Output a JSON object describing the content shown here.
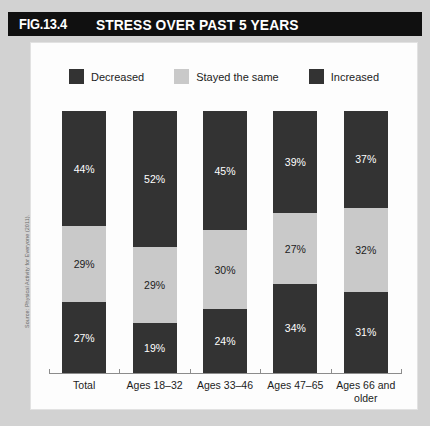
{
  "header": {
    "figure_number": "FIG.13.4",
    "title": "STRESS OVER PAST 5 YEARS"
  },
  "source": {
    "note": "Source: Physical Activity for Everyone (2011)."
  },
  "colors": {
    "banner": "#101010",
    "decreased": "#333333",
    "stayed_the_same": "#c9c9c9",
    "increased": "#333333",
    "panel_background": "#fdfdfd",
    "page_background": "#d2d2d2"
  },
  "chart_data": {
    "type": "bar",
    "subtype": "stacked-100-percent",
    "orientation": "vertical",
    "title": "STRESS OVER PAST 5 YEARS",
    "xlabel": "",
    "ylabel": "",
    "ylim": [
      0,
      100
    ],
    "grid": false,
    "legend_position": "top-center",
    "value_suffix": "%",
    "categories": [
      "Total",
      "Ages 18–32",
      "Ages 33–46",
      "Ages 47–65",
      "Ages 66 and older"
    ],
    "series": [
      {
        "name": "Increased",
        "color": "#333333",
        "values": [
          44,
          52,
          45,
          39,
          37
        ]
      },
      {
        "name": "Stayed the same",
        "color": "#c9c9c9",
        "values": [
          29,
          29,
          30,
          27,
          32
        ]
      },
      {
        "name": "Decreased",
        "color": "#333333",
        "values": [
          27,
          19,
          24,
          34,
          31
        ]
      }
    ],
    "stack_order_top_to_bottom": [
      "Increased",
      "Stayed the same",
      "Decreased"
    ],
    "bars": [
      {
        "category": "Total",
        "segments": [
          {
            "label": "44%",
            "value": 44,
            "series": "Increased",
            "tone": "dark"
          },
          {
            "label": "29%",
            "value": 29,
            "series": "Stayed the same",
            "tone": "light"
          },
          {
            "label": "27%",
            "value": 27,
            "series": "Decreased",
            "tone": "dark"
          }
        ]
      },
      {
        "category": "Ages 18–32",
        "segments": [
          {
            "label": "52%",
            "value": 52,
            "series": "Increased",
            "tone": "dark"
          },
          {
            "label": "29%",
            "value": 29,
            "series": "Stayed the same",
            "tone": "light"
          },
          {
            "label": "19%",
            "value": 19,
            "series": "Decreased",
            "tone": "dark"
          }
        ]
      },
      {
        "category": "Ages 33–46",
        "segments": [
          {
            "label": "45%",
            "value": 45,
            "series": "Increased",
            "tone": "dark"
          },
          {
            "label": "30%",
            "value": 30,
            "series": "Stayed the same",
            "tone": "light"
          },
          {
            "label": "24%",
            "value": 24,
            "series": "Decreased",
            "tone": "dark"
          }
        ]
      },
      {
        "category": "Ages 47–65",
        "segments": [
          {
            "label": "39%",
            "value": 39,
            "series": "Increased",
            "tone": "dark"
          },
          {
            "label": "27%",
            "value": 27,
            "series": "Stayed the same",
            "tone": "light"
          },
          {
            "label": "34%",
            "value": 34,
            "series": "Decreased",
            "tone": "dark"
          }
        ]
      },
      {
        "category": "Ages 66 and older",
        "segments": [
          {
            "label": "37%",
            "value": 37,
            "series": "Increased",
            "tone": "dark"
          },
          {
            "label": "32%",
            "value": 32,
            "series": "Stayed the same",
            "tone": "light"
          },
          {
            "label": "31%",
            "value": 31,
            "series": "Decreased",
            "tone": "dark"
          }
        ]
      }
    ],
    "legend": [
      {
        "label": "Decreased",
        "color": "#333333"
      },
      {
        "label": "Stayed the same",
        "color": "#c9c9c9"
      },
      {
        "label": "Increased",
        "color": "#333333"
      }
    ]
  }
}
